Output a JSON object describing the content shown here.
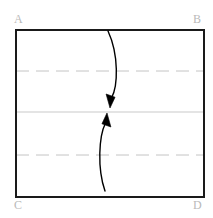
{
  "figure": {
    "background_color": "#ffffff",
    "frame": {
      "name": "outer-rectangle",
      "stroke_color": "#1a1a1a",
      "stroke_width": 2,
      "left": 16,
      "top": 30,
      "right": 204,
      "bottom": 197
    },
    "labels": [
      {
        "id": "A",
        "text": "A",
        "position": "top-left",
        "color": "#b9b9b9"
      },
      {
        "id": "B",
        "text": "B",
        "position": "top-right",
        "color": "#b9b9b9"
      },
      {
        "id": "C",
        "text": "C",
        "position": "bottom-left",
        "color": "#b9b9b9"
      },
      {
        "id": "D",
        "text": "D",
        "position": "bottom-right",
        "color": "#b9b9b9"
      }
    ],
    "guide_lines": [
      {
        "name": "upper-dashed-guide",
        "style": "dashed",
        "y": 71,
        "color": "#c4c4c4",
        "stroke_width": 1,
        "dash_pattern": "13 7"
      },
      {
        "name": "middle-solid-guide",
        "style": "solid",
        "y": 112,
        "color": "#c9c9c9",
        "stroke_width": 1,
        "dash_pattern": ""
      },
      {
        "name": "lower-dashed-guide",
        "style": "dashed",
        "y": 155,
        "color": "#c4c4c4",
        "stroke_width": 1,
        "dash_pattern": "13 7"
      }
    ],
    "arrows": [
      {
        "name": "upper-fold-arrow",
        "direction": "down",
        "color": "#000000",
        "stroke_width": 1.4,
        "start": {
          "x": 108,
          "y": 31
        },
        "end": {
          "x": 110,
          "y": 108
        },
        "control_1": {
          "x": 119,
          "y": 55
        },
        "control_2": {
          "x": 118,
          "y": 86
        }
      },
      {
        "name": "lower-fold-arrow",
        "direction": "up",
        "color": "#000000",
        "stroke_width": 1.4,
        "start": {
          "x": 105,
          "y": 191
        },
        "end": {
          "x": 107,
          "y": 113
        },
        "control_1": {
          "x": 97,
          "y": 168
        },
        "control_2": {
          "x": 99,
          "y": 136
        }
      }
    ]
  }
}
